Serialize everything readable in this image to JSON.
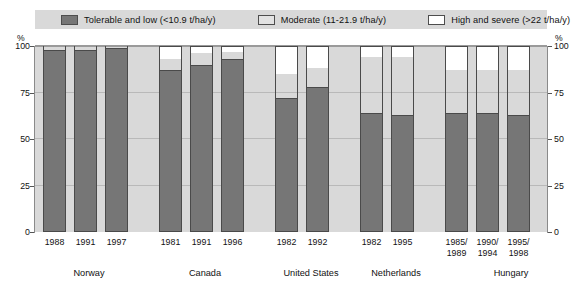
{
  "legend": {
    "items": [
      {
        "label": "Tolerable and low (<10.9 t/ha/y)",
        "color": "#767676",
        "key": "low"
      },
      {
        "label": "Moderate (11-21.9 t/ha/y)",
        "color": "#e2e2e2",
        "key": "moderate"
      },
      {
        "label": "High and severe (>22 t/ha/y)",
        "color": "#ffffff",
        "key": "high"
      }
    ]
  },
  "axes": {
    "unit_left": "%",
    "unit_right": "%",
    "y_ticks": [
      "100",
      "75",
      "50",
      "25",
      "0"
    ],
    "y_tick_values": [
      100,
      75,
      50,
      25,
      0
    ]
  },
  "chart_data": {
    "type": "bar",
    "stacked": true,
    "title": "",
    "xlabel": "",
    "ylabel": "%",
    "ylim": [
      0,
      100
    ],
    "grid": true,
    "legend_position": "top",
    "categories": [
      "1988",
      "1991",
      "1997",
      "1981",
      "1991",
      "1996",
      "1982",
      "1992",
      "1982",
      "1995",
      "1985/\n1989",
      "1990/\n1994",
      "1995/\n1998"
    ],
    "groups": [
      {
        "name": "Norway",
        "categories": [
          "1988",
          "1991",
          "1997"
        ]
      },
      {
        "name": "Canada",
        "categories": [
          "1981",
          "1991",
          "1996"
        ]
      },
      {
        "name": "United States",
        "categories": [
          "1982",
          "1992"
        ]
      },
      {
        "name": "Netherlands",
        "categories": [
          "1982",
          "1995"
        ]
      },
      {
        "name": "Hungary",
        "categories": [
          "1985/\n1989",
          "1990/\n1994",
          "1995/\n1998"
        ]
      }
    ],
    "series": [
      {
        "name": "Tolerable and low (<10.9 t/ha/y)",
        "key": "low",
        "values": [
          98,
          98,
          99,
          87,
          90,
          93,
          72,
          78,
          64,
          63,
          64,
          64,
          63
        ]
      },
      {
        "name": "Moderate (11-21.9 t/ha/y)",
        "key": "moderate",
        "values": [
          2,
          2,
          1,
          6,
          6,
          4,
          13,
          10,
          30,
          31,
          23,
          23,
          24
        ]
      },
      {
        "name": "High and severe (>22 t/ha/y)",
        "key": "high",
        "values": [
          0,
          0,
          0,
          7,
          4,
          3,
          15,
          12,
          6,
          6,
          13,
          13,
          13
        ]
      }
    ]
  },
  "layout": {
    "bars": [
      {
        "index": 0,
        "x": 8
      },
      {
        "index": 1,
        "x": 39
      },
      {
        "index": 2,
        "x": 70
      },
      {
        "index": 3,
        "x": 124
      },
      {
        "index": 4,
        "x": 155
      },
      {
        "index": 5,
        "x": 186
      },
      {
        "index": 6,
        "x": 240
      },
      {
        "index": 7,
        "x": 271
      },
      {
        "index": 8,
        "x": 325
      },
      {
        "index": 9,
        "x": 356
      },
      {
        "index": 10,
        "x": 410
      },
      {
        "index": 11,
        "x": 441
      },
      {
        "index": 12,
        "x": 472
      }
    ],
    "group_label_x": [
      54,
      170,
      276,
      361,
      476
    ]
  }
}
